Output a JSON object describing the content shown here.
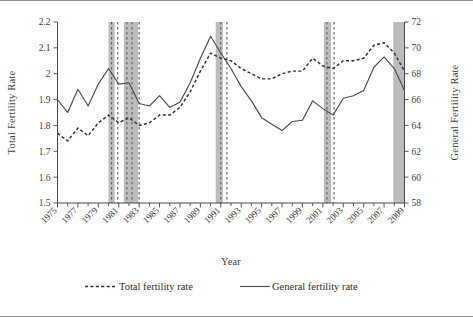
{
  "figure": {
    "background": "#ffffff",
    "border_color": "#8e8e8e",
    "band_color": "#b8b8b8",
    "line_color": "#3a3a3a"
  },
  "labels": {
    "y_left_title": "Total Fertility Rate",
    "y_right_title": "General Fertility Rate",
    "x_title": "Year",
    "legend_total": "Total fertility rate",
    "legend_general": "General fertility rate"
  },
  "chart_data": {
    "type": "line",
    "title": "",
    "xlabel": "Year",
    "ylabel": "Total Fertility Rate",
    "y2label": "General Fertility Rate",
    "grid": false,
    "legend_position": "bottom",
    "x": [
      1975,
      1976,
      1977,
      1978,
      1979,
      1980,
      1981,
      1982,
      1983,
      1984,
      1985,
      1986,
      1987,
      1988,
      1989,
      1990,
      1991,
      1992,
      1993,
      1994,
      1995,
      1996,
      1997,
      1998,
      1999,
      2000,
      2001,
      2002,
      2003,
      2004,
      2005,
      2006,
      2007,
      2008,
      2009
    ],
    "xtick_labels": [
      "1975",
      "1977",
      "1979",
      "1981",
      "1983",
      "1985",
      "1987",
      "1989",
      "1991",
      "1993",
      "1995",
      "1997",
      "1999",
      "2001",
      "2003",
      "2005",
      "2007",
      "2009"
    ],
    "xtick_values": [
      1975,
      1977,
      1979,
      1981,
      1983,
      1985,
      1987,
      1989,
      1991,
      1993,
      1995,
      1997,
      1999,
      2001,
      2003,
      2005,
      2007,
      2009
    ],
    "xlim": [
      1975,
      2009
    ],
    "ylim_left": [
      1.5,
      2.2
    ],
    "ytick_left": [
      1.5,
      1.6,
      1.7,
      1.8,
      1.9,
      2.0,
      2.1,
      2.2
    ],
    "ytick_left_labels": [
      "1.5",
      "1.6",
      "1.7",
      "1.8",
      "1.9",
      "2",
      "2.1",
      "2.2"
    ],
    "ylim_right": [
      58,
      72
    ],
    "ytick_right": [
      58,
      60,
      62,
      64,
      66,
      68,
      70,
      72
    ],
    "ytick_right_labels": [
      "58",
      "60",
      "62",
      "64",
      "66",
      "68",
      "70",
      "72"
    ],
    "series": [
      {
        "name": "Total fertility rate",
        "axis": "left",
        "style": "dashed",
        "values": [
          1.77,
          1.74,
          1.79,
          1.76,
          1.81,
          1.84,
          1.81,
          1.83,
          1.8,
          1.81,
          1.84,
          1.84,
          1.87,
          1.93,
          2.01,
          2.08,
          2.06,
          2.05,
          2.02,
          2.0,
          1.98,
          1.98,
          2.0,
          2.01,
          2.01,
          2.06,
          2.03,
          2.02,
          2.05,
          2.05,
          2.06,
          2.11,
          2.12,
          2.08,
          2.01
        ]
      },
      {
        "name": "General fertility rate",
        "axis": "right",
        "style": "solid",
        "values": [
          66.0,
          65.0,
          66.8,
          65.5,
          67.2,
          68.4,
          67.2,
          67.3,
          65.7,
          65.5,
          66.3,
          65.4,
          65.8,
          67.3,
          69.2,
          70.9,
          69.6,
          68.4,
          67.0,
          65.9,
          64.6,
          64.1,
          63.6,
          64.3,
          64.4,
          65.9,
          65.3,
          64.8,
          66.1,
          66.3,
          66.7,
          68.5,
          69.3,
          68.4,
          66.7
        ]
      }
    ],
    "shaded_recession_bands": [
      {
        "start": 1980.0,
        "end": 1980.6
      },
      {
        "start": 1981.5,
        "end": 1982.9
      },
      {
        "start": 1990.5,
        "end": 1991.2
      },
      {
        "start": 2001.1,
        "end": 2001.8
      },
      {
        "start": 2007.9,
        "end": 2009.0
      }
    ],
    "dashed_vertical_lines": [
      1980.3,
      1980.9,
      1981.8,
      1982.3,
      1983.0,
      1991.0,
      1991.6,
      2001.4,
      2002.1
    ]
  }
}
